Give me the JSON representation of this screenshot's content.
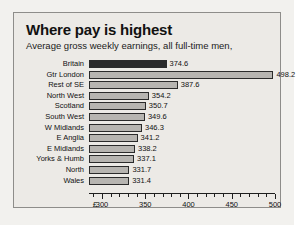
{
  "chart_data": {
    "type": "bar",
    "orientation": "horizontal",
    "title": "Where pay is highest",
    "subtitle": "Average gross weekly earnings, all full-time men,",
    "xlabel": "£",
    "ylabel": "",
    "xlim": [
      285,
      500
    ],
    "grid": false,
    "legend": null,
    "categories": [
      "Britain",
      "Gtr London",
      "Rest of SE",
      "North West",
      "Scotland",
      "South West",
      "W Midlands",
      "E Anglia",
      "E Midlands",
      "Yorks & Humb",
      "North",
      "Wales"
    ],
    "values": [
      374.6,
      498.2,
      387.6,
      354.2,
      350.7,
      349.6,
      346.3,
      341.2,
      338.2,
      337.1,
      331.7,
      331.4
    ],
    "value_labels": [
      "374.6",
      "498.2",
      "387.6",
      "354.2",
      "350.7",
      "349.6",
      "346.3",
      "341.2",
      "338.2",
      "337.1",
      "331.7",
      "331.4"
    ],
    "highlight_index": 0,
    "highlight_color": "#2a2a2a",
    "bar_color": "#b7b5b1",
    "bar_edge_color": "#2b2b2b",
    "axis_ticks_major": [
      300,
      350,
      400,
      450,
      500
    ],
    "axis_tick_labels": [
      "300",
      "350",
      "400",
      "450",
      "500"
    ],
    "axis_tick_minor_step": 10,
    "axis_origin_label": "£",
    "background_color": "#eceae6",
    "border_color": "#8e8d8a",
    "text_color": "#111111"
  }
}
